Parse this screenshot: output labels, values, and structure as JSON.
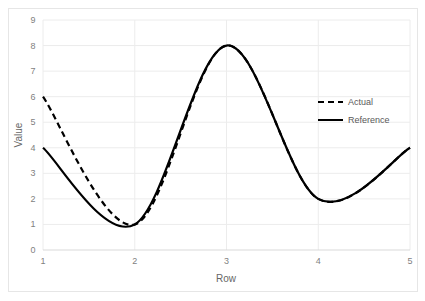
{
  "chart_data": {
    "type": "line",
    "title": "",
    "xlabel": "Row",
    "ylabel": "Value",
    "xlim": [
      1,
      5
    ],
    "ylim": [
      0,
      9
    ],
    "x_ticks": [
      "1",
      "2",
      "3",
      "4",
      "5"
    ],
    "y_ticks": [
      "0",
      "1",
      "2",
      "3",
      "4",
      "5",
      "6",
      "7",
      "8",
      "9"
    ],
    "grid": true,
    "legend_position": "right",
    "x": [
      1,
      2,
      3,
      4,
      5
    ],
    "series": [
      {
        "name": "Actual",
        "style": "dashed",
        "color": "#000000",
        "values": [
          6,
          1,
          8,
          2,
          4
        ]
      },
      {
        "name": "Reference",
        "style": "solid",
        "color": "#000000",
        "values": [
          4,
          1,
          8,
          2,
          4
        ]
      }
    ]
  },
  "legend": {
    "items": [
      {
        "label": "Actual"
      },
      {
        "label": "Reference"
      }
    ]
  },
  "axes": {
    "xlabel": "Row",
    "ylabel": "Value"
  }
}
